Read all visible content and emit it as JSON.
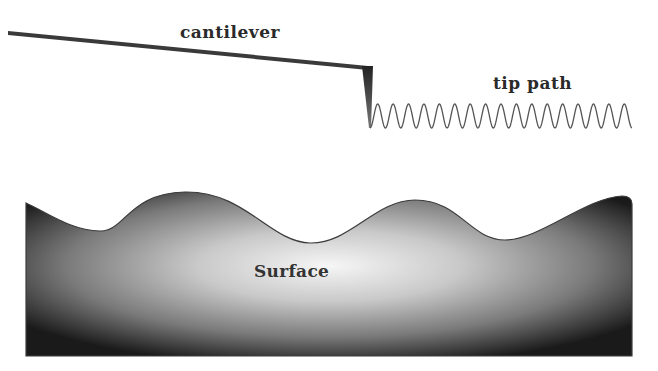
{
  "diagram": {
    "labels": {
      "cantilever": "cantilever",
      "tip_path": "tip path",
      "surface": "Surface"
    },
    "elements": {
      "cantilever": {
        "start": [
          8,
          32
        ],
        "end": [
          368,
          67
        ],
        "color": "#3a3a3a"
      },
      "tip": {
        "base_y": 67,
        "apex": [
          370,
          128
        ],
        "color": "#2b2b2b"
      },
      "tip_path": {
        "x_start": 370,
        "x_end": 632,
        "y_center": 116,
        "amplitude": 12,
        "cycles": 17,
        "color": "#555555"
      },
      "surface": {
        "left": 26,
        "right": 632,
        "bottom": 356,
        "edge_color": "#444444",
        "gradient_center": "#f4f4f4",
        "gradient_edge": "#1c1c1c"
      }
    }
  }
}
